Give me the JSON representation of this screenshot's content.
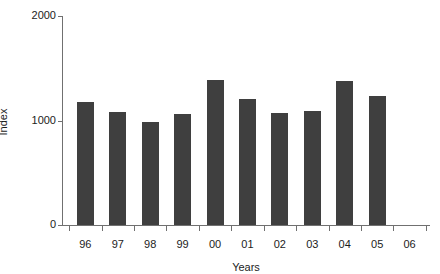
{
  "chart_data": {
    "type": "bar",
    "title": "",
    "subtitle": "",
    "xlabel": "Years",
    "ylabel": "Index",
    "categories": [
      "96",
      "97",
      "98",
      "99",
      "00",
      "01",
      "02",
      "03",
      "04",
      "05",
      "06"
    ],
    "values": [
      1180,
      1085,
      990,
      1060,
      1390,
      1210,
      1075,
      1095,
      1380,
      1230,
      null
    ],
    "series": [
      {
        "name": "Index",
        "values": [
          1180,
          1085,
          990,
          1060,
          1390,
          1210,
          1075,
          1095,
          1380,
          1230,
          null
        ]
      }
    ],
    "ylim": [
      0,
      2000
    ],
    "yticks": [
      0,
      1000,
      2000
    ],
    "ytick_labels": [
      "0",
      "1000",
      "2000"
    ],
    "xtick_labels": [
      "96",
      "97",
      "98",
      "99",
      "00",
      "01",
      "02",
      "03",
      "04",
      "05",
      "06"
    ],
    "grid": false,
    "legend": null,
    "legend_position": "none",
    "bar_color": "#3f3f3f",
    "axis_color": "#707070",
    "text_color": "#1c1c1c",
    "background": "#ffffff",
    "annotations": [
      "Category 06 has a tick mark and label but no bar plotted."
    ]
  }
}
